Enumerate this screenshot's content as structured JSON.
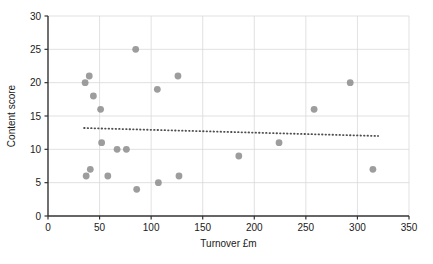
{
  "chart_data": {
    "type": "scatter",
    "title": "",
    "xlabel": "Turnover £m",
    "ylabel": "Content score",
    "xlim": [
      0,
      350
    ],
    "ylim": [
      0,
      30
    ],
    "xticks": [
      0,
      50,
      100,
      150,
      200,
      250,
      300,
      350
    ],
    "yticks": [
      0,
      5,
      10,
      15,
      20,
      25,
      30
    ],
    "grid": true,
    "legend": "none",
    "series": [
      {
        "name": "Companies",
        "marker": "circle",
        "color": "#8c8c8c",
        "points": [
          {
            "x": 36,
            "y": 20.0
          },
          {
            "x": 37,
            "y": 6.0
          },
          {
            "x": 40,
            "y": 21.0
          },
          {
            "x": 41,
            "y": 7.0
          },
          {
            "x": 44,
            "y": 18.0
          },
          {
            "x": 51,
            "y": 16.0
          },
          {
            "x": 52,
            "y": 11.0
          },
          {
            "x": 58,
            "y": 6.0
          },
          {
            "x": 67,
            "y": 10.0
          },
          {
            "x": 76,
            "y": 10.0
          },
          {
            "x": 85,
            "y": 25.0
          },
          {
            "x": 86,
            "y": 4.0
          },
          {
            "x": 106,
            "y": 19.0
          },
          {
            "x": 107,
            "y": 5.0
          },
          {
            "x": 126,
            "y": 21.0
          },
          {
            "x": 127,
            "y": 6.0
          },
          {
            "x": 185,
            "y": 9.0
          },
          {
            "x": 224,
            "y": 11.0
          },
          {
            "x": 258,
            "y": 16.0
          },
          {
            "x": 293,
            "y": 20.0
          },
          {
            "x": 315,
            "y": 7.0
          }
        ]
      }
    ],
    "trendline": {
      "name": "Linear trend",
      "style": "dotted",
      "color": "#4d4d4d",
      "x_start": 35,
      "y_start": 13.2,
      "x_end": 320,
      "y_end": 12.0
    }
  }
}
